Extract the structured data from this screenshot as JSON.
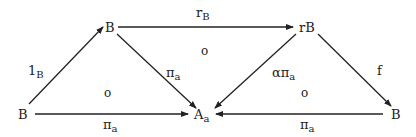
{
  "diagram": {
    "type": "commutative-diagram",
    "nodes": [
      {
        "id": "B_left",
        "label": "B",
        "sub": ""
      },
      {
        "id": "B_top",
        "label": "B",
        "sub": ""
      },
      {
        "id": "A_a",
        "label": "A",
        "sub": "a"
      },
      {
        "id": "rB",
        "label": "rB",
        "sub": ""
      },
      {
        "id": "B_right",
        "label": "B",
        "sub": ""
      }
    ],
    "edges": [
      {
        "from": "B_left",
        "to": "B_top",
        "label": "1",
        "sub": "B"
      },
      {
        "from": "B_top",
        "to": "rB",
        "label": "r",
        "sub": "B"
      },
      {
        "from": "B_top",
        "to": "A_a",
        "label": "π",
        "sub": "a"
      },
      {
        "from": "B_left",
        "to": "A_a",
        "label": "π",
        "sub": "a"
      },
      {
        "from": "rB",
        "to": "A_a",
        "label": "απ",
        "sub": "a"
      },
      {
        "from": "rB",
        "to": "B_right",
        "label": "f",
        "sub": ""
      },
      {
        "from": "B_right",
        "to": "A_a",
        "label": "π",
        "sub": "a"
      }
    ],
    "cell_marks": [
      {
        "region": "left-triangle",
        "symbol": "o"
      },
      {
        "region": "middle-triangle",
        "symbol": "o"
      },
      {
        "region": "right-triangle",
        "symbol": "o"
      }
    ]
  }
}
